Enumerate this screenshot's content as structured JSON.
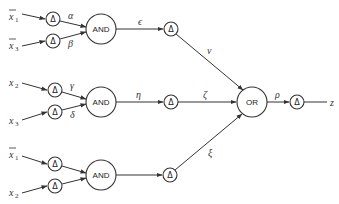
{
  "diagram": {
    "type": "logic-network",
    "inputs": [
      {
        "id": "in1",
        "var": "x",
        "sub": "1",
        "negated": true
      },
      {
        "id": "in2",
        "var": "x",
        "sub": "3",
        "negated": true
      },
      {
        "id": "in3",
        "var": "x",
        "sub": "2",
        "negated": false
      },
      {
        "id": "in4",
        "var": "x",
        "sub": "3",
        "negated": false
      },
      {
        "id": "in5",
        "var": "x",
        "sub": "1",
        "negated": true
      },
      {
        "id": "in6",
        "var": "x",
        "sub": "2",
        "negated": false
      }
    ],
    "delay_symbol": "Δ",
    "gates": {
      "and1": "AND",
      "and2": "AND",
      "and3": "AND",
      "or": "OR"
    },
    "edge_labels": {
      "alpha": "α",
      "beta": "β",
      "gamma": "γ",
      "delta": "δ",
      "epsilon": "ϵ",
      "eta": "η",
      "zeta": "ζ",
      "nu": "ν",
      "xi": "ξ",
      "rho": "ρ"
    },
    "output": "z"
  }
}
